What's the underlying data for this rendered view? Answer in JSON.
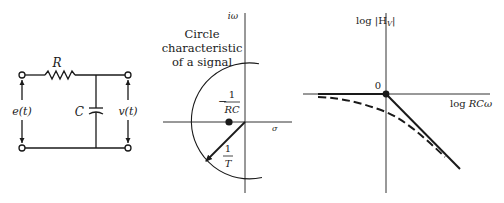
{
  "circuit": {
    "resistor_label": "R",
    "capacitor_label": "C",
    "input_label": "e(t)",
    "output_label": "v(t)"
  },
  "pole_zero_plot": {
    "imag_axis_label": "iω",
    "real_axis_label": "σ",
    "annotation_line1": "Circle",
    "annotation_line2": "characteristic",
    "annotation_line3": "of a signal",
    "pole_label_sign": "−",
    "pole_label_num": "1",
    "pole_label_den": "RC",
    "radius_label_num": "1",
    "radius_label_den": "T"
  },
  "bode_plot": {
    "y_axis_label": "log |H",
    "y_axis_subscript": "V",
    "y_axis_label_end": "|",
    "x_axis_label_prefix": "log ",
    "x_axis_label_var": "RCω",
    "origin_label": "0"
  },
  "colors": {
    "ink": "#1a1a1a",
    "axis": "#333333",
    "background": "#ffffff"
  }
}
